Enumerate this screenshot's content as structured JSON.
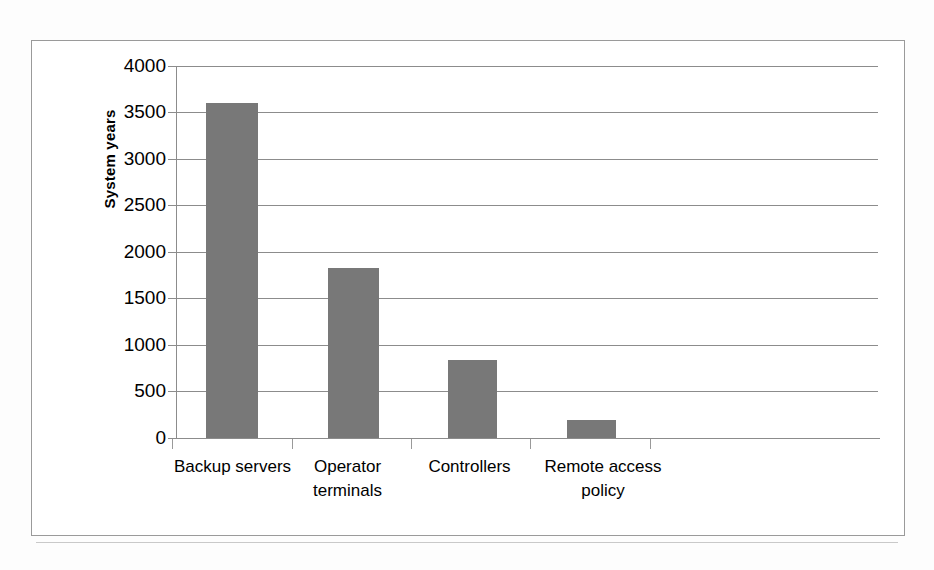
{
  "chart_data": {
    "type": "bar",
    "title": "",
    "xlabel": "",
    "ylabel": "System years",
    "categories": [
      "Backup servers",
      "Operator terminals",
      "Controllers",
      "Remote access policy"
    ],
    "values": [
      3600,
      1825,
      840,
      195
    ],
    "ylim": [
      0,
      4000
    ],
    "ytick_labels": [
      "4000",
      "3500",
      "3000",
      "2500",
      "2000",
      "1500",
      "1000",
      "500",
      "0"
    ],
    "ytick_values": [
      4000,
      3500,
      3000,
      2500,
      2000,
      1500,
      1000,
      500,
      0
    ],
    "ytick_step": 500,
    "grid": "horizontal",
    "legend": "none",
    "series": [
      {
        "name": "System years",
        "values": [
          3600,
          1825,
          840,
          195
        ],
        "color": "#787878"
      }
    ],
    "bar_color": "#787878",
    "axis_color": "#8c8c8c",
    "gridline_color": "#8c8c8c",
    "background": "#ffffff",
    "annotations": []
  },
  "axis": {
    "y_title": "System years"
  },
  "category_labels": [
    {
      "line1": "Backup servers",
      "line2": ""
    },
    {
      "line1": "Operator",
      "line2": "terminals"
    },
    {
      "line1": "Controllers",
      "line2": ""
    },
    {
      "line1": "Remote access",
      "line2": "policy"
    }
  ]
}
